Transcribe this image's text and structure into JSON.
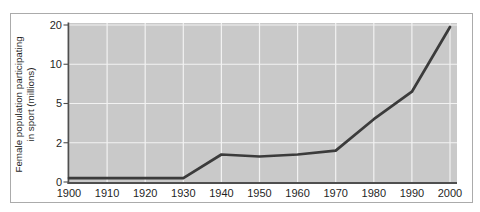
{
  "chart_data": {
    "type": "line",
    "title": "",
    "xlabel": "",
    "ylabel": "Female population participating in sport (millions)",
    "ylabel_lines": [
      "Female population participating",
      "in sport (millions)"
    ],
    "x_ticks": [
      "1900",
      "1910",
      "1920",
      "1930",
      "1940",
      "1950",
      "1960",
      "1970",
      "1980",
      "1990",
      "2000"
    ],
    "y_ticks": [
      0,
      2,
      5,
      10,
      20
    ],
    "y_scale": "non-linear: tick values 0, 2, 5, 10, 20 are equally spaced",
    "xlim": [
      1900,
      2000
    ],
    "ylim": [
      0,
      20
    ],
    "grid": true,
    "legend": "none",
    "series": [
      {
        "name": "Female population participating in sport (millions)",
        "x": [
          1900,
          1910,
          1920,
          1930,
          1940,
          1950,
          1960,
          1970,
          1980,
          1990,
          2000
        ],
        "values": [
          0.2,
          0.2,
          0.2,
          0.2,
          1.4,
          1.3,
          1.4,
          1.6,
          3.8,
          6.5,
          19.5
        ]
      }
    ],
    "colors": {
      "plot_background": "#c9c9c9",
      "gridline": "#f2f2f2",
      "line": "#3b3b3b",
      "axis": "#4f4f4f",
      "tick_text": "#1f1f1f",
      "frame_border": "#ababab",
      "page_background": "#ffffff"
    }
  }
}
